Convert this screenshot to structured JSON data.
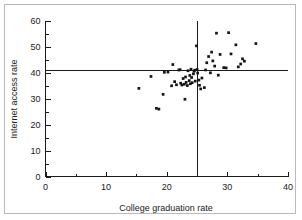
{
  "chart_data": {
    "type": "scatter",
    "title": "",
    "xlabel": "College graduation rate",
    "ylabel": "Internet access rate",
    "xlim": [
      0,
      40
    ],
    "ylim": [
      0,
      60
    ],
    "xticks": [
      0,
      10,
      20,
      30,
      40
    ],
    "yticks": [
      0,
      10,
      20,
      30,
      40,
      50,
      60
    ],
    "xticks_minor": [
      5,
      15,
      25,
      35
    ],
    "yticks_minor": [
      5,
      15,
      25,
      35,
      45,
      55
    ],
    "grid": false,
    "legend": false,
    "marker": "square",
    "marker_color": "#141414",
    "reference_lines": [
      {
        "orientation": "horizontal",
        "value": 41,
        "axis": "y"
      },
      {
        "orientation": "vertical",
        "value": 25,
        "axis": "x"
      }
    ],
    "points": [
      {
        "x": 15.4,
        "y": 34.0
      },
      {
        "x": 17.4,
        "y": 38.6
      },
      {
        "x": 18.3,
        "y": 26.3
      },
      {
        "x": 18.7,
        "y": 26.0
      },
      {
        "x": 19.4,
        "y": 31.7
      },
      {
        "x": 19.6,
        "y": 40.2
      },
      {
        "x": 20.2,
        "y": 40.3
      },
      {
        "x": 20.8,
        "y": 35.0
      },
      {
        "x": 21.0,
        "y": 43.2
      },
      {
        "x": 21.3,
        "y": 36.6
      },
      {
        "x": 21.6,
        "y": 35.4
      },
      {
        "x": 22.0,
        "y": 41.1
      },
      {
        "x": 22.2,
        "y": 41.2
      },
      {
        "x": 22.3,
        "y": 36.0
      },
      {
        "x": 22.5,
        "y": 35.3
      },
      {
        "x": 22.7,
        "y": 37.8
      },
      {
        "x": 22.9,
        "y": 35.6
      },
      {
        "x": 23.0,
        "y": 29.8
      },
      {
        "x": 23.1,
        "y": 38.4
      },
      {
        "x": 23.2,
        "y": 36.3
      },
      {
        "x": 23.4,
        "y": 35.1
      },
      {
        "x": 23.5,
        "y": 40.8
      },
      {
        "x": 23.7,
        "y": 37.0
      },
      {
        "x": 23.8,
        "y": 39.0
      },
      {
        "x": 23.9,
        "y": 35.8
      },
      {
        "x": 24.0,
        "y": 41.4
      },
      {
        "x": 24.1,
        "y": 38.2
      },
      {
        "x": 24.2,
        "y": 36.2
      },
      {
        "x": 24.4,
        "y": 39.6
      },
      {
        "x": 24.5,
        "y": 40.6
      },
      {
        "x": 24.6,
        "y": 41.0
      },
      {
        "x": 24.7,
        "y": 36.8
      },
      {
        "x": 24.9,
        "y": 50.4
      },
      {
        "x": 25.0,
        "y": 41.3
      },
      {
        "x": 25.1,
        "y": 39.9
      },
      {
        "x": 25.3,
        "y": 37.2
      },
      {
        "x": 25.4,
        "y": 35.2
      },
      {
        "x": 25.6,
        "y": 33.8
      },
      {
        "x": 25.8,
        "y": 38.0
      },
      {
        "x": 26.2,
        "y": 34.3
      },
      {
        "x": 26.4,
        "y": 41.1
      },
      {
        "x": 26.6,
        "y": 43.9
      },
      {
        "x": 26.9,
        "y": 46.3
      },
      {
        "x": 27.2,
        "y": 40.0
      },
      {
        "x": 27.4,
        "y": 48.0
      },
      {
        "x": 27.6,
        "y": 44.6
      },
      {
        "x": 27.9,
        "y": 42.6
      },
      {
        "x": 28.2,
        "y": 55.3
      },
      {
        "x": 28.5,
        "y": 39.1
      },
      {
        "x": 28.8,
        "y": 47.1
      },
      {
        "x": 29.4,
        "y": 42.0
      },
      {
        "x": 29.8,
        "y": 41.9
      },
      {
        "x": 30.2,
        "y": 55.5
      },
      {
        "x": 30.6,
        "y": 47.3
      },
      {
        "x": 31.4,
        "y": 50.8
      },
      {
        "x": 31.8,
        "y": 42.3
      },
      {
        "x": 32.2,
        "y": 43.4
      },
      {
        "x": 32.5,
        "y": 45.4
      },
      {
        "x": 32.8,
        "y": 44.5
      },
      {
        "x": 34.7,
        "y": 51.3
      }
    ]
  }
}
